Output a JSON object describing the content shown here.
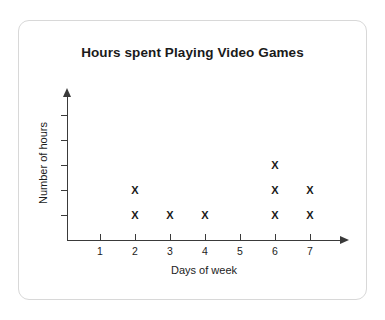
{
  "card": {
    "background_color": "#ffffff",
    "border_color": "#d8d8d8"
  },
  "chart_data": {
    "type": "scatter",
    "plot_style": "dot-plot",
    "title": "Hours spent Playing Video Games",
    "xlabel": "Days of week",
    "ylabel": "Number of hours",
    "categories": [
      "1",
      "2",
      "3",
      "4",
      "5",
      "6",
      "7"
    ],
    "values": [
      0,
      2,
      1,
      1,
      0,
      3,
      2
    ],
    "marker": "X",
    "marker_color": "#1a1a1a",
    "axis_color": "#3a3a3a",
    "xlim": [
      0,
      7.8
    ],
    "ylim": [
      0,
      5
    ],
    "x_ticks": [
      "1",
      "2",
      "3",
      "4",
      "5",
      "6",
      "7"
    ],
    "y_ticks": [
      "",
      "",
      "",
      "",
      ""
    ],
    "y_tick_count": 5,
    "grid": false,
    "legend": false,
    "axis_arrows": true,
    "series": [
      {
        "name": "Hours spent Playing Video Games",
        "points": [
          {
            "x": "1",
            "count": 0,
            "marks": []
          },
          {
            "x": "2",
            "count": 2,
            "marks": [
              "X",
              "X"
            ]
          },
          {
            "x": "3",
            "count": 1,
            "marks": [
              "X"
            ]
          },
          {
            "x": "4",
            "count": 1,
            "marks": [
              "X"
            ]
          },
          {
            "x": "5",
            "count": 0,
            "marks": []
          },
          {
            "x": "6",
            "count": 3,
            "marks": [
              "X",
              "X",
              "X"
            ]
          },
          {
            "x": "7",
            "count": 2,
            "marks": [
              "X",
              "X"
            ]
          }
        ]
      }
    ]
  }
}
